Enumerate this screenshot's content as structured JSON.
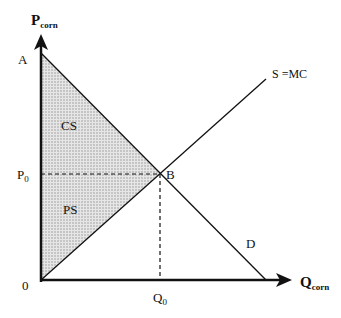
{
  "diagram": {
    "y_axis_label": "P",
    "y_axis_sub": "corn",
    "x_axis_label": "Q",
    "x_axis_sub": "corn",
    "point_a": "A",
    "point_b": "B",
    "price_label": "P",
    "price_sub": "0",
    "quantity_label": "Q",
    "quantity_sub": "0",
    "origin": "0",
    "consumer_surplus": "CS",
    "producer_surplus": "PS",
    "supply_label": "S =MC",
    "demand_label": "D"
  }
}
